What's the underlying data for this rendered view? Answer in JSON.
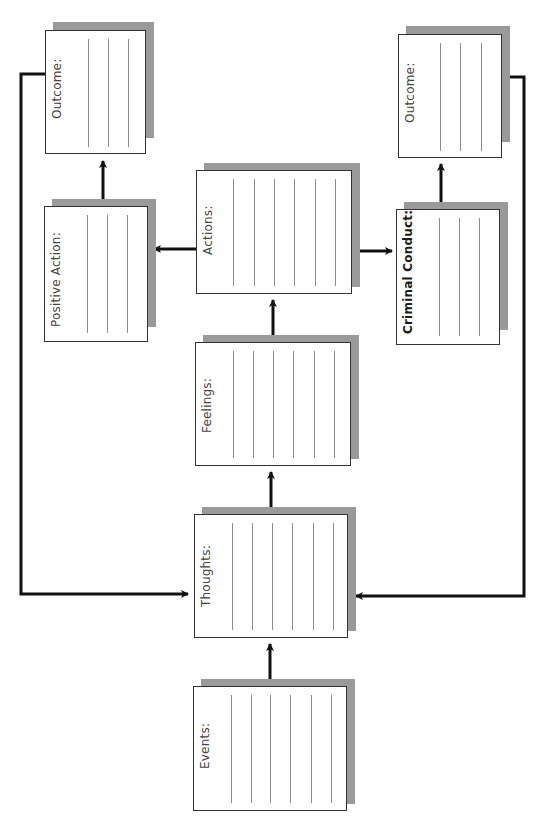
{
  "diagram": {
    "type": "flowchart",
    "boxes": [
      {
        "id": "events",
        "label": "Events:",
        "bold": false,
        "x": 193,
        "y": 686,
        "w": 154,
        "h": 125,
        "lines": 6
      },
      {
        "id": "thoughts",
        "label": "Thoughts:",
        "bold": false,
        "x": 194,
        "y": 514,
        "w": 154,
        "h": 124,
        "lines": 6
      },
      {
        "id": "feelings",
        "label": "Feelings:",
        "bold": false,
        "x": 195,
        "y": 342,
        "w": 156,
        "h": 124,
        "lines": 6
      },
      {
        "id": "actions",
        "label": "Actions:",
        "bold": false,
        "x": 196,
        "y": 170,
        "w": 156,
        "h": 124,
        "lines": 6
      },
      {
        "id": "positive_action",
        "label": "Positive Action:",
        "bold": false,
        "x": 44,
        "y": 206,
        "w": 104,
        "h": 136,
        "lines": 3
      },
      {
        "id": "criminal_conduct",
        "label": "Criminal Conduct:",
        "bold": true,
        "x": 396,
        "y": 209,
        "w": 104,
        "h": 136,
        "lines": 3
      },
      {
        "id": "outcome_positive",
        "label": "Outcome:",
        "bold": false,
        "x": 45,
        "y": 30,
        "w": 101,
        "h": 124,
        "lines": 3
      },
      {
        "id": "outcome_criminal",
        "label": "Outcome:",
        "bold": false,
        "x": 398,
        "y": 34,
        "w": 104,
        "h": 124,
        "lines": 3
      }
    ],
    "edges": [
      {
        "from": "events",
        "to": "thoughts"
      },
      {
        "from": "thoughts",
        "to": "feelings"
      },
      {
        "from": "feelings",
        "to": "actions"
      },
      {
        "from": "actions",
        "to": "positive_action"
      },
      {
        "from": "actions",
        "to": "criminal_conduct"
      },
      {
        "from": "positive_action",
        "to": "outcome_positive"
      },
      {
        "from": "criminal_conduct",
        "to": "outcome_criminal"
      },
      {
        "from": "outcome_positive",
        "to": "thoughts"
      },
      {
        "from": "outcome_criminal",
        "to": "thoughts"
      }
    ],
    "colors": {
      "box_border": "#333333",
      "box_fill": "#ffffff",
      "shadow": "#9a9a9a",
      "writing_lines": "#8c8c8c",
      "arrows": "#111111"
    }
  }
}
